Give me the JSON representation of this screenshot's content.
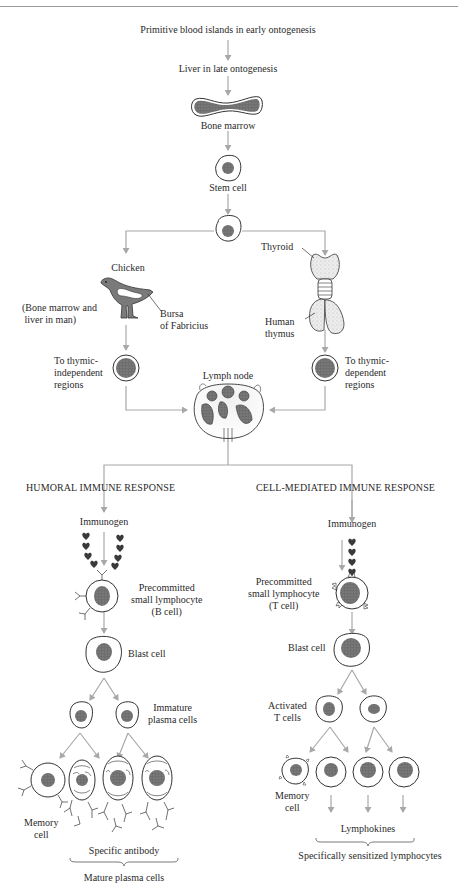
{
  "colors": {
    "arrow": "#a8a8a8",
    "outline": "#333333",
    "nucleus": "#5a5a5a",
    "organ_fill": "#7a7a7a",
    "thymus_fill": "#e6e6e6",
    "antigen": "#3a3a3a"
  },
  "top": {
    "origin": "Primitive blood islands in early ontogenesis",
    "liver": "Liver in late ontogenesis",
    "bone_marrow": "Bone marrow",
    "stem_cell": "Stem cell"
  },
  "left_branch": {
    "chicken": "Chicken",
    "human_equiv": "(Bone marrow and\n liver in man)",
    "bursa": "Bursa\nof Fabricius",
    "destination": "To thymic-\nindependent\nregions"
  },
  "right_branch": {
    "thyroid": "Thyroid",
    "thymus": "Human\nthymus",
    "destination": "To thymic-\ndependent\nregions"
  },
  "center": {
    "lymph_node": "Lymph node"
  },
  "humoral": {
    "title": "HUMORAL IMMUNE RESPONSE",
    "immunogen": "Immunogen",
    "b_cell": "Precommitted\nsmall lymphocyte\n(B cell)",
    "blast": "Blast cell",
    "immature": "Immature\nplasma cells",
    "memory": "Memory\ncell",
    "antibody": "Specific antibody",
    "mature": "Mature plasma cells"
  },
  "cell_mediated": {
    "title": "CELL-MEDIATED IMMUNE RESPONSE",
    "immunogen": "Immunogen",
    "t_cell": "Precommitted\nsmall lymphocyte\n(T cell)",
    "blast": "Blast cell",
    "activated": "Activated\nT cells",
    "memory": "Memory\ncell",
    "lymphokines": "Lymphokines",
    "sensitized": "Specifically sensitized lymphocytes"
  }
}
